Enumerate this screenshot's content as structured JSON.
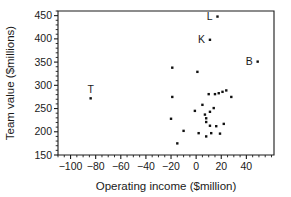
{
  "chart_data": {
    "type": "scatter",
    "title": "",
    "xlabel": "Operating income ($million)",
    "ylabel": "Team value ($millions)",
    "xlim": [
      -110,
      62
    ],
    "ylim": [
      150,
      460
    ],
    "xticks": [
      -100,
      -80,
      -60,
      -40,
      -20,
      0,
      20,
      40
    ],
    "yticks": [
      150,
      200,
      250,
      300,
      350,
      400,
      450
    ],
    "xtick_labels": [
      "−100",
      "−80",
      "−60",
      "−40",
      "−20",
      "0",
      "20",
      "40"
    ],
    "ytick_labels": [
      "150",
      "200",
      "250",
      "300",
      "350",
      "400",
      "450"
    ],
    "xtick_minor_step": 5,
    "ytick_minor_step": 10,
    "grid": false,
    "legend": "none",
    "marker": "filled-square",
    "marker_color": "#111111",
    "points": [
      {
        "x": -84,
        "y": 272,
        "label": "T",
        "label_pos": "above"
      },
      {
        "x": 17,
        "y": 448,
        "label": "L",
        "label_pos": "left"
      },
      {
        "x": 11,
        "y": 398,
        "label": "K",
        "label_pos": "left"
      },
      {
        "x": 49,
        "y": 351,
        "label": "B",
        "label_pos": "left"
      },
      {
        "x": -19,
        "y": 338,
        "label": "",
        "label_pos": ""
      },
      {
        "x": 1,
        "y": 329,
        "label": "",
        "label_pos": ""
      },
      {
        "x": -19,
        "y": 275,
        "label": "",
        "label_pos": ""
      },
      {
        "x": -20,
        "y": 228,
        "label": "",
        "label_pos": ""
      },
      {
        "x": -15,
        "y": 175,
        "label": "",
        "label_pos": ""
      },
      {
        "x": -10,
        "y": 202,
        "label": "",
        "label_pos": ""
      },
      {
        "x": -1,
        "y": 245,
        "label": "",
        "label_pos": ""
      },
      {
        "x": 2,
        "y": 197,
        "label": "",
        "label_pos": ""
      },
      {
        "x": 5,
        "y": 258,
        "label": "",
        "label_pos": ""
      },
      {
        "x": 7,
        "y": 237,
        "label": "",
        "label_pos": ""
      },
      {
        "x": 8,
        "y": 229,
        "label": "",
        "label_pos": ""
      },
      {
        "x": 8,
        "y": 221,
        "label": "",
        "label_pos": ""
      },
      {
        "x": 8,
        "y": 190,
        "label": "",
        "label_pos": ""
      },
      {
        "x": 10,
        "y": 281,
        "label": "",
        "label_pos": ""
      },
      {
        "x": 11,
        "y": 243,
        "label": "",
        "label_pos": ""
      },
      {
        "x": 11,
        "y": 213,
        "label": "",
        "label_pos": ""
      },
      {
        "x": 12,
        "y": 197,
        "label": "",
        "label_pos": ""
      },
      {
        "x": 14,
        "y": 251,
        "label": "",
        "label_pos": ""
      },
      {
        "x": 15,
        "y": 281,
        "label": "",
        "label_pos": ""
      },
      {
        "x": 16,
        "y": 212,
        "label": "",
        "label_pos": ""
      },
      {
        "x": 18,
        "y": 283,
        "label": "",
        "label_pos": ""
      },
      {
        "x": 19,
        "y": 196,
        "label": "",
        "label_pos": ""
      },
      {
        "x": 21,
        "y": 286,
        "label": "",
        "label_pos": ""
      },
      {
        "x": 22,
        "y": 217,
        "label": "",
        "label_pos": ""
      },
      {
        "x": 24,
        "y": 289,
        "label": "",
        "label_pos": ""
      },
      {
        "x": 28,
        "y": 275,
        "label": "",
        "label_pos": ""
      }
    ]
  },
  "plot": {
    "frame": {
      "left": 58,
      "right": 274,
      "top": 11,
      "bottom": 155
    }
  }
}
